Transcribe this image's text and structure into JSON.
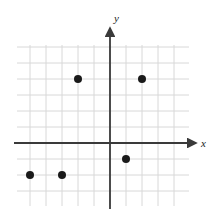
{
  "figure": {
    "title": "",
    "background_color": "#ffffff"
  },
  "axis_labels": {
    "x": "x",
    "y": "y"
  },
  "colors": {
    "grid": "#d8d8d8",
    "axis": "#3a3a3a",
    "point": "#1a1a1a",
    "background": "#ffffff"
  },
  "chart_data": {
    "type": "scatter",
    "title": "",
    "xlabel": "x",
    "ylabel": "y",
    "grid": true,
    "legend": "none",
    "xlim": [
      -6,
      5
    ],
    "ylim": [
      -4,
      6
    ],
    "xticks": [
      -6,
      -5,
      -4,
      -3,
      -2,
      -1,
      0,
      1,
      2,
      3,
      4,
      5
    ],
    "yticks": [
      -4,
      -3,
      -2,
      -1,
      0,
      1,
      2,
      3,
      4,
      5,
      6
    ],
    "tick_labels_shown": false,
    "x": [
      -2,
      2,
      -5,
      -3,
      1
    ],
    "y": [
      4,
      4,
      -2,
      -2,
      -1
    ],
    "points": [
      {
        "label": "point-1",
        "x": -2,
        "y": 4
      },
      {
        "label": "point-2",
        "x": 2,
        "y": 4
      },
      {
        "label": "point-3",
        "x": -5,
        "y": -2
      },
      {
        "label": "point-4",
        "x": -3,
        "y": -2
      },
      {
        "label": "point-5",
        "x": 1,
        "y": -1
      }
    ],
    "marker": {
      "shape": "circle",
      "radius_px": 4,
      "color": "#1a1a1a"
    }
  },
  "geometry": {
    "origin_px": {
      "x": 110,
      "y": 143
    },
    "cell_px": 16,
    "grid_rect_px": {
      "left": 17,
      "top": 45,
      "right": 189,
      "bottom": 206
    },
    "x_axis_arrow_end_px": 196,
    "y_axis_arrow_end_px": 28
  }
}
